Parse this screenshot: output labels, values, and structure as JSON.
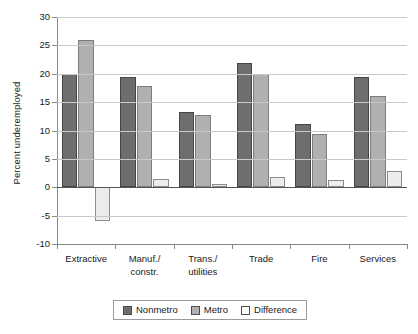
{
  "chart_data": {
    "type": "bar",
    "title": "",
    "subtitle": "",
    "xlabel": "",
    "ylabel": "Percent underemployed",
    "ylim": [
      -10,
      30
    ],
    "ytick_step": 5,
    "yticks": [
      "30",
      "25",
      "20",
      "15",
      "10",
      "5",
      "0",
      "-5",
      "-10"
    ],
    "ytick_values": [
      30,
      25,
      20,
      15,
      10,
      5,
      0,
      -5,
      -10
    ],
    "grid": "horizontal",
    "legend_position": "bottom-center",
    "categories": [
      "Extractive",
      "Manuf./\nconstr.",
      "Trans./\nutilities",
      "Trade",
      "Fire",
      "Services"
    ],
    "series": [
      {
        "name": "Nonmetro",
        "color": "#6e6e6e",
        "values": [
          20.0,
          19.4,
          13.3,
          21.9,
          11.2,
          19.4
        ]
      },
      {
        "name": "Metro",
        "color": "#b0b0b0",
        "values": [
          25.9,
          17.9,
          12.7,
          19.9,
          9.4,
          16.1
        ]
      },
      {
        "name": "Difference",
        "color": "#ececec",
        "values": [
          -5.9,
          1.5,
          0.6,
          1.8,
          1.3,
          2.9
        ]
      }
    ]
  },
  "legend": {
    "items": [
      {
        "label": "Nonmetro"
      },
      {
        "label": "Metro"
      },
      {
        "label": "Difference"
      }
    ]
  },
  "colors": {
    "nonmetro": "#6e6e6e",
    "metro": "#b0b0b0",
    "difference": "#ececec",
    "gridline": "#c9c9c9",
    "axis": "#8a8a8a",
    "zero_line": "#555555"
  }
}
